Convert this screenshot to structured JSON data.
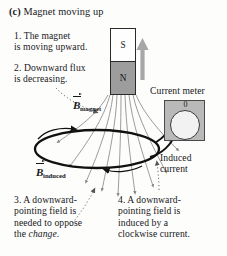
{
  "figure": {
    "label": "(c)",
    "title": "Magnet moving up"
  },
  "notes": {
    "n1": "1. The magnet\nis moving upward.",
    "n2": "2. Downward flux\nis decreasing.",
    "n3_pre": "3. A downward-\npointing field is\nneeded to oppose\nthe ",
    "n3_italic": "change",
    "n3_post": ".",
    "n4": "4. A downward-\npointing field is\ninduced by a\nclockwise current."
  },
  "magnet": {
    "top_pole": "S",
    "bottom_pole": "N",
    "motion_arrow": "up-arrow-icon"
  },
  "meter": {
    "caption": "Current meter",
    "scale_label": "0",
    "needle": "meter-needle-icon"
  },
  "labels": {
    "b_magnet_symbol": "B",
    "b_magnet_subscript": "magnet",
    "b_induced_symbol": "B",
    "b_induced_subscript": "induced",
    "induced_current": "Induced\ncurrent"
  },
  "colors": {
    "magnet_north_fill": "#9d9d9d",
    "magnet_south_fill": "#fefefe",
    "meter_body": "#b9b9b9",
    "meter_dial": "#f2f2f2",
    "field_line": "#8a8a8a",
    "loop_wire": "#111111",
    "background": "#fdfdfc",
    "text": "#17171a"
  }
}
